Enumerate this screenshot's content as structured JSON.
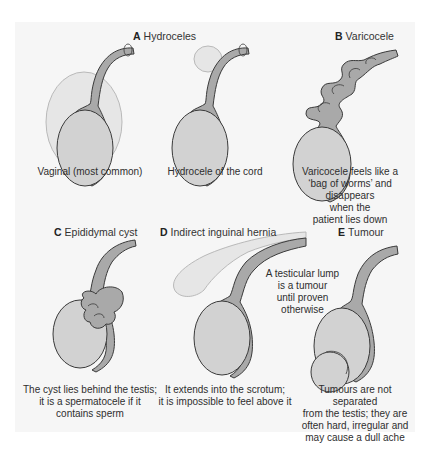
{
  "colors": {
    "panel_bg": "#f6f6f6",
    "testis_fill": "#d2d2d2",
    "epididymis_fill": "#a9a9a9",
    "fluid_fill": "#e6e6e6",
    "outline": "#3a3a3a"
  },
  "panels": [
    {
      "letter": "A",
      "title": "Hydroceles",
      "subfigures": [
        {
          "caption": "Vaginal (most common)"
        },
        {
          "caption": "Hydrocele of the cord"
        }
      ]
    },
    {
      "letter": "B",
      "title": "Varicocele",
      "caption_lines": [
        "Varicocele feels like a",
        "‘bag of worms’ and disappears",
        "when the",
        "patient lies down"
      ]
    },
    {
      "letter": "C",
      "title": "Epididymal cyst",
      "caption_lines": [
        "The cyst lies behind the testis;",
        "it is a spermatocele if it",
        "contains sperm"
      ]
    },
    {
      "letter": "D",
      "title": "Indirect inguinal hernia",
      "caption_lines": [
        "It extends into the scrotum;",
        "it is impossible to feel above it"
      ]
    },
    {
      "letter": "E",
      "title": "Tumour",
      "annotation_lines": [
        "A testicular lump",
        "is a tumour",
        "until proven",
        "otherwise"
      ],
      "caption_lines": [
        "Tumours are not separated",
        "from the testis; they are",
        "often hard, irregular and",
        "may cause a dull ache"
      ]
    }
  ]
}
